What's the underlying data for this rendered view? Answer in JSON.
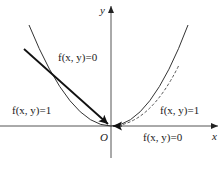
{
  "diagram": {
    "axes": {
      "x_label": "x",
      "y_label": "y",
      "origin_label": "O"
    },
    "regions": [
      {
        "id": "upper-middle",
        "text": "f(x, y)=0"
      },
      {
        "id": "left",
        "text": "f(x, y)=1"
      },
      {
        "id": "right",
        "text": "f(x, y)=1"
      },
      {
        "id": "below-right",
        "text": "f(x, y)=0"
      }
    ],
    "curves": [
      {
        "name": "parabola",
        "style": "solid"
      },
      {
        "name": "inner-curve",
        "style": "dashed"
      }
    ],
    "arrows": [
      {
        "name": "approach-arrow-left",
        "direction": "toward origin"
      },
      {
        "name": "approach-arrow-right",
        "direction": "toward origin"
      }
    ],
    "colors": {
      "stroke": "#222222",
      "background": "#ffffff"
    }
  }
}
